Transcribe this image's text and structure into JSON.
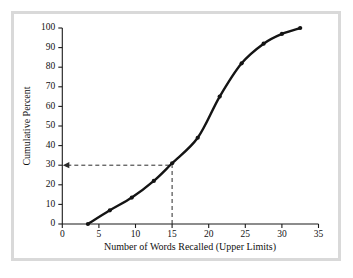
{
  "chart_data": {
    "type": "line",
    "title": "",
    "xlabel": "Number of Words Recalled (Upper Limits)",
    "ylabel": "Cumulative Percent",
    "xlim": [
      0,
      35
    ],
    "ylim": [
      0,
      100
    ],
    "xticks": [
      0,
      5,
      10,
      15,
      20,
      25,
      30,
      35
    ],
    "yticks": [
      0,
      10,
      20,
      30,
      40,
      50,
      60,
      70,
      80,
      90,
      100
    ],
    "grid": false,
    "legend": "none",
    "series": [
      {
        "name": "Cumulative percent of words recalled",
        "marker": "filled-circle",
        "color": "#141414",
        "x": [
          3.5,
          6.5,
          9.5,
          12.5,
          15,
          18.5,
          21.5,
          24.5,
          27.5,
          30,
          32.5
        ],
        "values": [
          0,
          7,
          13.5,
          22,
          31,
          44,
          65,
          82,
          92,
          97,
          100
        ]
      }
    ],
    "annotations": [
      {
        "name": "median-reference",
        "type": "dashed-guide",
        "x": 15,
        "y": 30,
        "arrow": "left-at-y-axis",
        "description": "Dashed vertical line at x = 15 rising to the curve, then dashed horizontal line left to the y-axis at 30 percent, ending in an arrowhead."
      }
    ]
  },
  "axis_labels": {
    "x_title": "Number of Words Recalled (Upper Limits)",
    "y_title": "Cumulative Percent",
    "x_tick_labels": [
      "0",
      "5",
      "10",
      "15",
      "20",
      "25",
      "30",
      "35"
    ],
    "y_tick_labels": [
      "0",
      "10",
      "20",
      "30",
      "40",
      "50",
      "60",
      "70",
      "80",
      "90",
      "100"
    ]
  },
  "colors": {
    "curve": "#141414",
    "axis": "#1a1a1a",
    "reference": "#2b2b2b",
    "frame": "#d9d9d9",
    "background": "#ffffff"
  }
}
